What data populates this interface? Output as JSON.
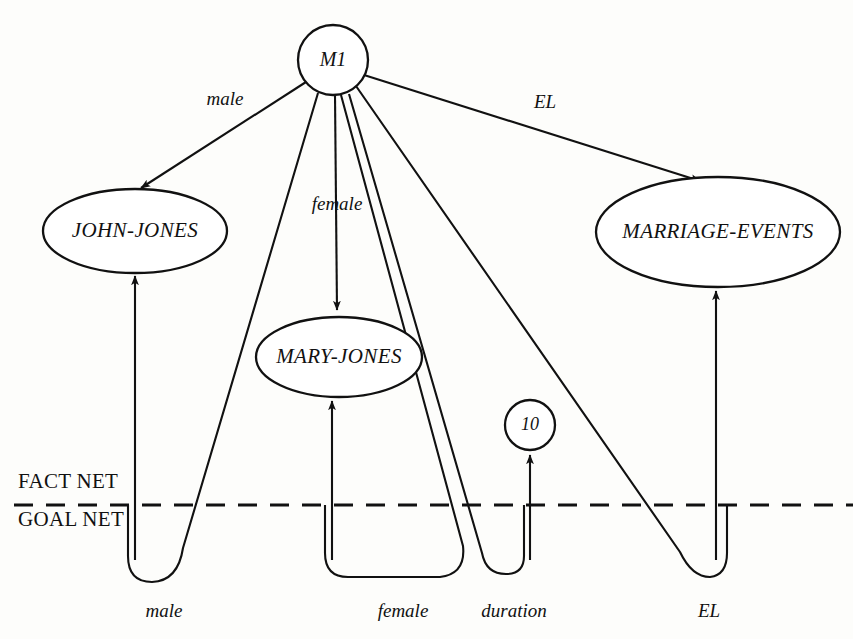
{
  "diagram": {
    "width": 853,
    "height": 639,
    "ink_color": "#111111",
    "background_color": "#fdfdfb"
  },
  "nodes": {
    "m1": {
      "label": "M1",
      "shape": "circle",
      "cx": 333,
      "cy": 60,
      "r": 35
    },
    "john_jones": {
      "label": "JOHN-JONES",
      "shape": "ellipse",
      "cx": 135,
      "cy": 231,
      "rx": 92,
      "ry": 42
    },
    "mary_jones": {
      "label": "MARY-JONES",
      "shape": "ellipse",
      "cx": 339,
      "cy": 357,
      "rx": 83,
      "ry": 40
    },
    "marriage_events": {
      "label": "MARRIAGE-EVENTS",
      "shape": "ellipse",
      "cx": 718,
      "cy": 232,
      "rx": 122,
      "ry": 55
    },
    "ten": {
      "label": "10",
      "shape": "circle",
      "cx": 530,
      "cy": 425,
      "r": 25
    }
  },
  "fact_net_edges": [
    {
      "label": "male",
      "from": "m1",
      "to": "john_jones",
      "label_x": 225,
      "label_y": 101
    },
    {
      "label": "female",
      "from": "m1",
      "to": "mary_jones",
      "label_x": 337,
      "label_y": 206
    },
    {
      "label": "EL",
      "from": "m1",
      "to": "marriage_events",
      "label_x": 545,
      "label_y": 104
    }
  ],
  "goal_net_edges": [
    {
      "label": "male",
      "target": "john_jones",
      "label_x": 164,
      "label_y": 613
    },
    {
      "label": "female",
      "target": "mary_jones",
      "label_x": 403,
      "label_y": 613
    },
    {
      "label": "duration",
      "target": "ten",
      "label_x": 514,
      "label_y": 613
    },
    {
      "label": "EL",
      "target": "marriage_events",
      "label_x": 709,
      "label_y": 613
    }
  ],
  "divider": {
    "fact_net_label": "FACT NET",
    "goal_net_label": "GOAL NET",
    "fact_label_x": 18,
    "fact_label_y": 483,
    "goal_label_x": 18,
    "goal_label_y": 521,
    "line_y": 505,
    "line_x1": 14,
    "line_x2": 853
  }
}
